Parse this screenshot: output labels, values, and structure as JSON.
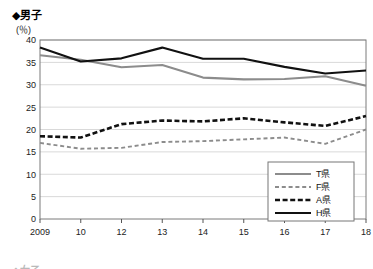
{
  "figure": {
    "title": "◆男子",
    "unit_label": "(％)",
    "x_axis_suffix": "(年)",
    "bottom_cut_label": "◆女子"
  },
  "colors": {
    "black": "#111111",
    "gray": "#8c8c8c",
    "grid": "#d9d9d9",
    "border": "#7a7a7a",
    "background": "#ffffff"
  },
  "legend": {
    "items": [
      {
        "label": "T県",
        "style": "solid",
        "color": "#8c8c8c"
      },
      {
        "label": "F県",
        "style": "dashed",
        "color": "#8c8c8c"
      },
      {
        "label": "A県",
        "style": "dashed",
        "color": "#111111"
      },
      {
        "label": "H県",
        "style": "solid",
        "color": "#111111"
      }
    ]
  },
  "chart_data": {
    "type": "line",
    "title": "◆男子",
    "xlabel": "(年)",
    "ylabel": "(％)",
    "ylim": [
      0,
      40
    ],
    "ytick_step": 5,
    "yticks": [
      0,
      5,
      10,
      15,
      20,
      25,
      30,
      35,
      40
    ],
    "grid": true,
    "legend_position": "bottom-right",
    "categories": [
      "2009",
      "10",
      "12",
      "13",
      "14",
      "15",
      "16",
      "17",
      "18"
    ],
    "series": [
      {
        "name": "T県",
        "color": "#8c8c8c",
        "style": "solid",
        "values": [
          36.6,
          35.6,
          33.9,
          34.4,
          31.6,
          31.2,
          31.3,
          31.9,
          29.8
        ]
      },
      {
        "name": "F県",
        "color": "#8c8c8c",
        "style": "dashed",
        "values": [
          17.0,
          15.7,
          15.9,
          17.2,
          17.4,
          17.8,
          18.2,
          16.8,
          20.0
        ]
      },
      {
        "name": "A県",
        "color": "#111111",
        "style": "dashed",
        "values": [
          18.5,
          18.2,
          21.2,
          22.0,
          21.8,
          22.5,
          21.6,
          20.8,
          23.0
        ]
      },
      {
        "name": "H県",
        "color": "#111111",
        "style": "solid",
        "values": [
          38.3,
          35.2,
          35.9,
          38.3,
          35.8,
          35.8,
          34.0,
          32.5,
          33.2
        ]
      }
    ]
  }
}
